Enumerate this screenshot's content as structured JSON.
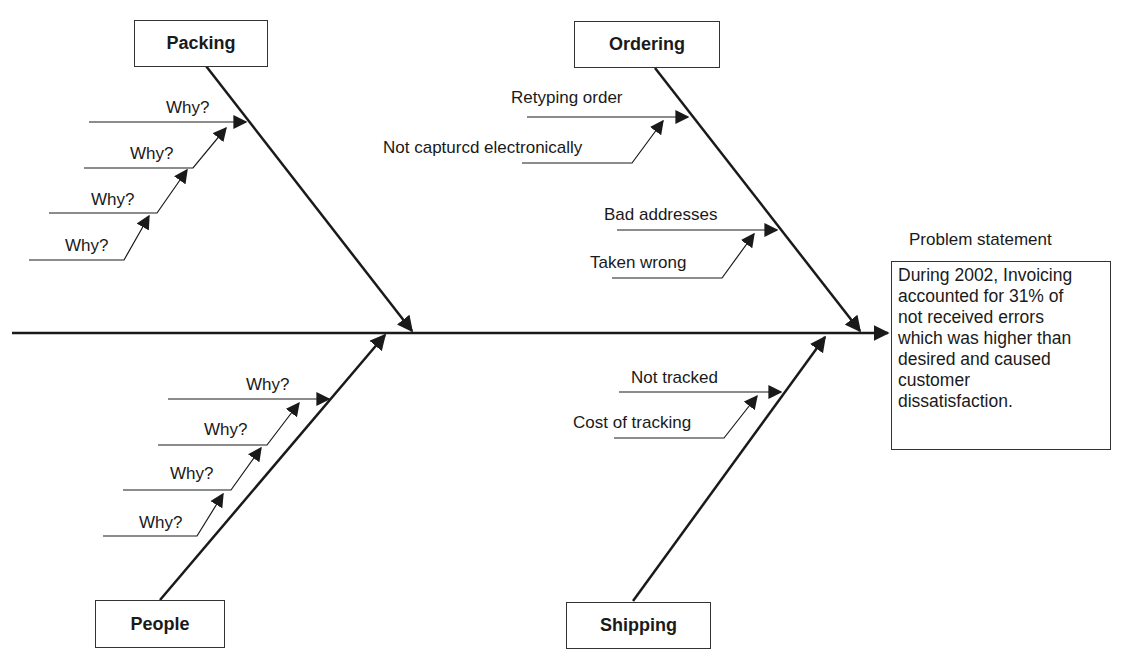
{
  "diagram": {
    "type": "fishbone",
    "categories": {
      "packing": {
        "label": "Packing",
        "causes": [
          "Why?",
          "Why?",
          "Why?",
          "Why?"
        ]
      },
      "ordering": {
        "label": "Ordering",
        "causes": [
          "Retyping order",
          "Not capturcd electronically",
          "Bad addresses",
          "Taken wrong"
        ]
      },
      "people": {
        "label": "People",
        "causes": [
          "Why?",
          "Why?",
          "Why?",
          "Why?"
        ]
      },
      "shipping": {
        "label": "Shipping",
        "causes": [
          "Not tracked",
          "Cost of tracking"
        ]
      }
    },
    "problem": {
      "title": "Problem statement",
      "lines": [
        "During 2002, Invoicing",
        "accounted for 31% of",
        "not received errors",
        "which was higher than",
        "desired and caused",
        "customer",
        "dissatisfaction."
      ]
    },
    "colors": {
      "line": "#1a1a1a",
      "background": "#ffffff"
    }
  }
}
